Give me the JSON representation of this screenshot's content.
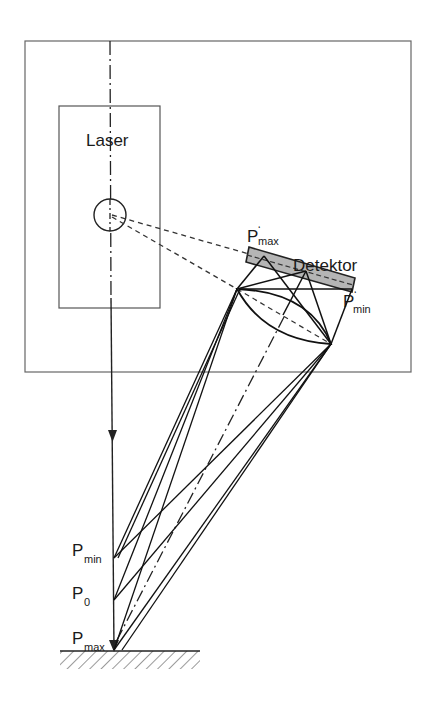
{
  "diagram": {
    "type": "laser triangulation sensor schematic",
    "labels": {
      "laser": "Laser",
      "detector": "Detektor",
      "p_max_prime": {
        "base": "P",
        "prime": "‘",
        "sub": "max"
      },
      "p_min_prime": {
        "base": "P",
        "prime": "‘",
        "sub": "min"
      },
      "p_min": {
        "base": "P",
        "sub": "min"
      },
      "p_0": {
        "base": "P",
        "sub": "0"
      },
      "p_max": {
        "base": "P",
        "sub": "max"
      }
    },
    "colors": {
      "line": "#1a1a1a",
      "frame": "#555555",
      "detector_fill": "#b0b0b0",
      "background": "#ffffff"
    },
    "components": [
      "sensor-housing",
      "laser-module",
      "laser-source",
      "optical-axis",
      "receiving-lens",
      "detector-array",
      "measurement-surface"
    ]
  }
}
